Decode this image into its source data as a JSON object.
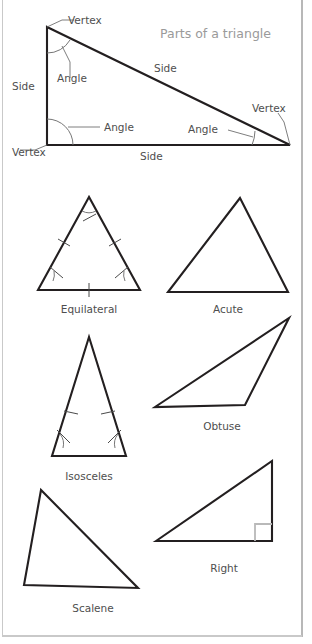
{
  "figure": {
    "title": "Parts of a triangle",
    "title_color": "#9a9a9a",
    "line_color": "#231f20",
    "label_color": "#4e4e4e",
    "marker_color": "#6f6f6f",
    "background": "#ffffff",
    "border_color": "#c9c9c9"
  },
  "parts_diagram": {
    "name": "parts-of-a-triangle",
    "labels": {
      "vertex_top": "Vertex",
      "vertex_bottom_left": "Vertex",
      "vertex_bottom_right": "Vertex",
      "side_left": "Side",
      "side_hypotenuse": "Side",
      "side_bottom": "Side",
      "angle_top": "Angle",
      "angle_bottom_left": "Angle",
      "angle_bottom_right": "Angle"
    },
    "geometry": {
      "apex": [
        47,
        27
      ],
      "bottom_left": [
        47,
        145
      ],
      "bottom_right": [
        290,
        145
      ]
    }
  },
  "triangle_gallery": [
    {
      "id": "equilateral",
      "label": "Equilateral",
      "markings": "three equal side ticks, three angle arcs",
      "points": "89,197 38,290 140,290"
    },
    {
      "id": "acute",
      "label": "Acute",
      "markings": "none",
      "points": "240,198 168,292 288,292"
    },
    {
      "id": "isosceles",
      "label": "Isosceles",
      "markings": "two equal leg ticks, two base angle arcs",
      "points": "89,337 52,456 126,456"
    },
    {
      "id": "obtuse",
      "label": "Obtuse",
      "markings": "none",
      "points": "155,407 289,318 245,405"
    },
    {
      "id": "right",
      "label": "Right",
      "markings": "right angle square marker",
      "points": "156,541 272,461 272,541"
    },
    {
      "id": "scalene",
      "label": "Scalene",
      "markings": "none",
      "points": "41,490 24,585 138,588"
    }
  ]
}
